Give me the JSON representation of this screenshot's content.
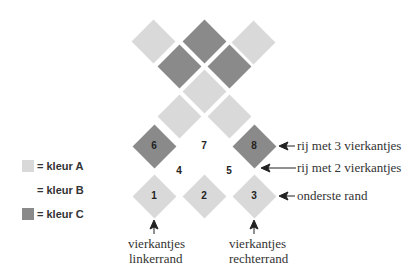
{
  "colors": {
    "kleur_A": "#d9d9d9",
    "kleur_B": "#ffffff",
    "kleur_C": "#8a8a8a"
  },
  "legend": [
    {
      "key": "A",
      "label": "= kleur A"
    },
    {
      "key": "B",
      "label": "= kleur B"
    },
    {
      "key": "C",
      "label": "= kleur C"
    }
  ],
  "numbers": {
    "n1": "1",
    "n2": "2",
    "n3": "3",
    "n4": "4",
    "n5": "5",
    "n6": "6",
    "n7": "7",
    "n8": "8"
  },
  "annotations": {
    "row3": "rij met 3 vierkantjes",
    "row2": "rij met 2 vierkantjes",
    "bottom_edge": "onderste rand",
    "left_edge_line1": "vierkantjes",
    "left_edge_line2": "linkerrand",
    "right_edge_line1": "vierkantjes",
    "right_edge_line2": "rechterrand"
  },
  "grid": [
    {
      "id": "top-left",
      "color": "A"
    },
    {
      "id": "top-mid",
      "color": "C"
    },
    {
      "id": "top-right",
      "color": "A"
    },
    {
      "id": "r2-left",
      "color": "C"
    },
    {
      "id": "r2-right",
      "color": "C"
    },
    {
      "id": "r3-mid",
      "color": "A"
    },
    {
      "id": "r4-left",
      "color": "A"
    },
    {
      "id": "r4-right",
      "color": "A"
    },
    {
      "id": "6",
      "color": "C"
    },
    {
      "id": "7",
      "color": "B"
    },
    {
      "id": "8",
      "color": "C"
    },
    {
      "id": "4",
      "color": "B"
    },
    {
      "id": "5",
      "color": "B"
    },
    {
      "id": "1",
      "color": "A"
    },
    {
      "id": "2",
      "color": "A"
    },
    {
      "id": "3",
      "color": "A"
    }
  ]
}
